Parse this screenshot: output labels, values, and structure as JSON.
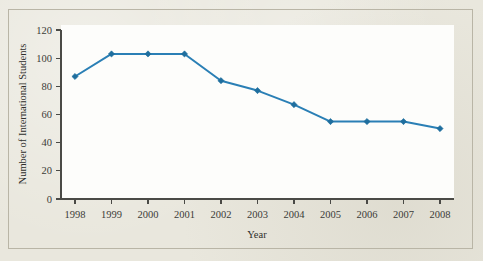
{
  "chart_data": {
    "type": "line",
    "title": "",
    "subtitle": "",
    "xlabel": "Year",
    "ylabel": "Number of International Students",
    "categories": [
      "1998",
      "1999",
      "2000",
      "2001",
      "2002",
      "2003",
      "2004",
      "2005",
      "2006",
      "2007",
      "2008"
    ],
    "x": [
      1998,
      1999,
      2000,
      2001,
      2002,
      2003,
      2004,
      2005,
      2006,
      2007,
      2008
    ],
    "values": [
      87,
      103,
      103,
      103,
      84,
      77,
      67,
      55,
      55,
      55,
      50
    ],
    "series": [
      {
        "name": "Number of International Students",
        "values": [
          87,
          103,
          103,
          103,
          84,
          77,
          67,
          55,
          55,
          55,
          50
        ]
      }
    ],
    "ylim": [
      0,
      120
    ],
    "yticks": [
      0,
      20,
      40,
      60,
      80,
      100,
      120
    ],
    "ytick_labels": [
      "0",
      "20",
      "40",
      "60",
      "80",
      "100",
      "120"
    ],
    "xtick_labels": [
      "1998",
      "1999",
      "2000",
      "2001",
      "2002",
      "2003",
      "2004",
      "2005",
      "2006",
      "2007",
      "2008"
    ],
    "grid": false,
    "legend": false,
    "legend_position": "none",
    "marker": "diamond",
    "line_color": "#2a7fb5",
    "marker_color": "#1f6e9e",
    "axis_color": "#4a4a46",
    "plot_background": "#fdfdfb",
    "figure_background": "#e9e7dd",
    "border_color": "#b9b5a6"
  }
}
